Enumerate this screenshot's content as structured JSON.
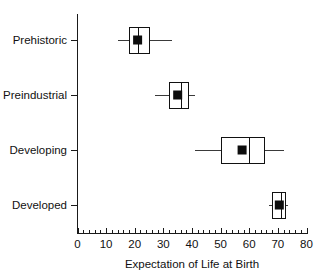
{
  "chart_data": {
    "type": "box",
    "title": "",
    "subtitle": "",
    "xlabel": "Expectation of Life at Birth",
    "ylabel": "",
    "xlim": [
      0,
      80
    ],
    "xticks": [
      0,
      10,
      20,
      30,
      40,
      50,
      60,
      70,
      80
    ],
    "xtick_labels": [
      "0",
      "10",
      "20",
      "30",
      "40",
      "50",
      "60",
      "70",
      "80"
    ],
    "minor_tick_step": 2,
    "grid": false,
    "legend": null,
    "orientation": "horizontal",
    "categories": [
      "Prehistoric",
      "Preindustrial",
      "Developing",
      "Developed"
    ],
    "boxes": [
      {
        "category": "Prehistoric",
        "whisker_low": 14.0,
        "q1": 18.0,
        "median": 21.0,
        "q3": 25.0,
        "whisker_high": 33.0,
        "mean": 21.0
      },
      {
        "category": "Preindustrial",
        "whisker_low": 27.0,
        "q1": 32.0,
        "median": 36.0,
        "q3": 38.5,
        "whisker_high": 41.0,
        "mean": 35.0
      },
      {
        "category": "Developing",
        "whisker_low": 41.0,
        "q1": 50.0,
        "median": 60.0,
        "q3": 65.0,
        "whisker_high": 72.0,
        "mean": 57.5
      },
      {
        "category": "Developed",
        "whisker_low": 67.0,
        "q1": 68.0,
        "median": 71.0,
        "q3": 72.5,
        "whisker_high": 73.5,
        "mean": 70.5
      }
    ]
  },
  "axis": {
    "x_title": "Expectation of Life at Birth",
    "x_tick_labels": [
      "0",
      "10",
      "20",
      "30",
      "40",
      "50",
      "60",
      "70",
      "80"
    ],
    "y_category_labels": [
      "Prehistoric",
      "Preindustrial",
      "Developing",
      "Developed"
    ]
  },
  "colors": {
    "box_stroke": "#111111",
    "box_fill": "#ffffff",
    "mean_marker": "#0d0d0d",
    "whisker": "#3a3a3a",
    "axis": "#1a1a1a",
    "text": "#111111",
    "background": "#ffffff"
  }
}
